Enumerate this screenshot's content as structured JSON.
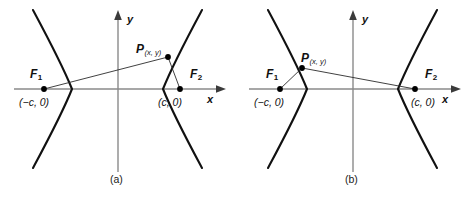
{
  "figure": {
    "type": "geometry-diagram",
    "background_color": "#ffffff",
    "curve_color": "#111111",
    "axis_color": "#8a8a8a",
    "segment_color": "#2b2b2b"
  },
  "panels": [
    {
      "id": "a",
      "caption": "(a)",
      "axes": {
        "x_label": "x",
        "y_label": "y"
      },
      "points": [
        {
          "key": "f1",
          "label": "F",
          "subscript": "1",
          "coord_label": "(−c, 0)"
        },
        {
          "key": "f2",
          "label": "F",
          "subscript": "2",
          "coord_label": "(c, 0)"
        },
        {
          "key": "p",
          "label": "P",
          "subscript": "(x, y)",
          "coord_label": ""
        }
      ],
      "p_branch": "right",
      "segments": [
        {
          "from": "f1",
          "to": "p"
        },
        {
          "from": "f2",
          "to": "p"
        }
      ]
    },
    {
      "id": "b",
      "caption": "(b)",
      "axes": {
        "x_label": "x",
        "y_label": "y"
      },
      "points": [
        {
          "key": "f1",
          "label": "F",
          "subscript": "1",
          "coord_label": "(−c, 0)"
        },
        {
          "key": "f2",
          "label": "F",
          "subscript": "2",
          "coord_label": "(c, 0)"
        },
        {
          "key": "p",
          "label": "P",
          "subscript": "(x, y)",
          "coord_label": ""
        }
      ],
      "p_branch": "left",
      "segments": [
        {
          "from": "f1",
          "to": "p"
        },
        {
          "from": "f2",
          "to": "p"
        }
      ]
    }
  ]
}
